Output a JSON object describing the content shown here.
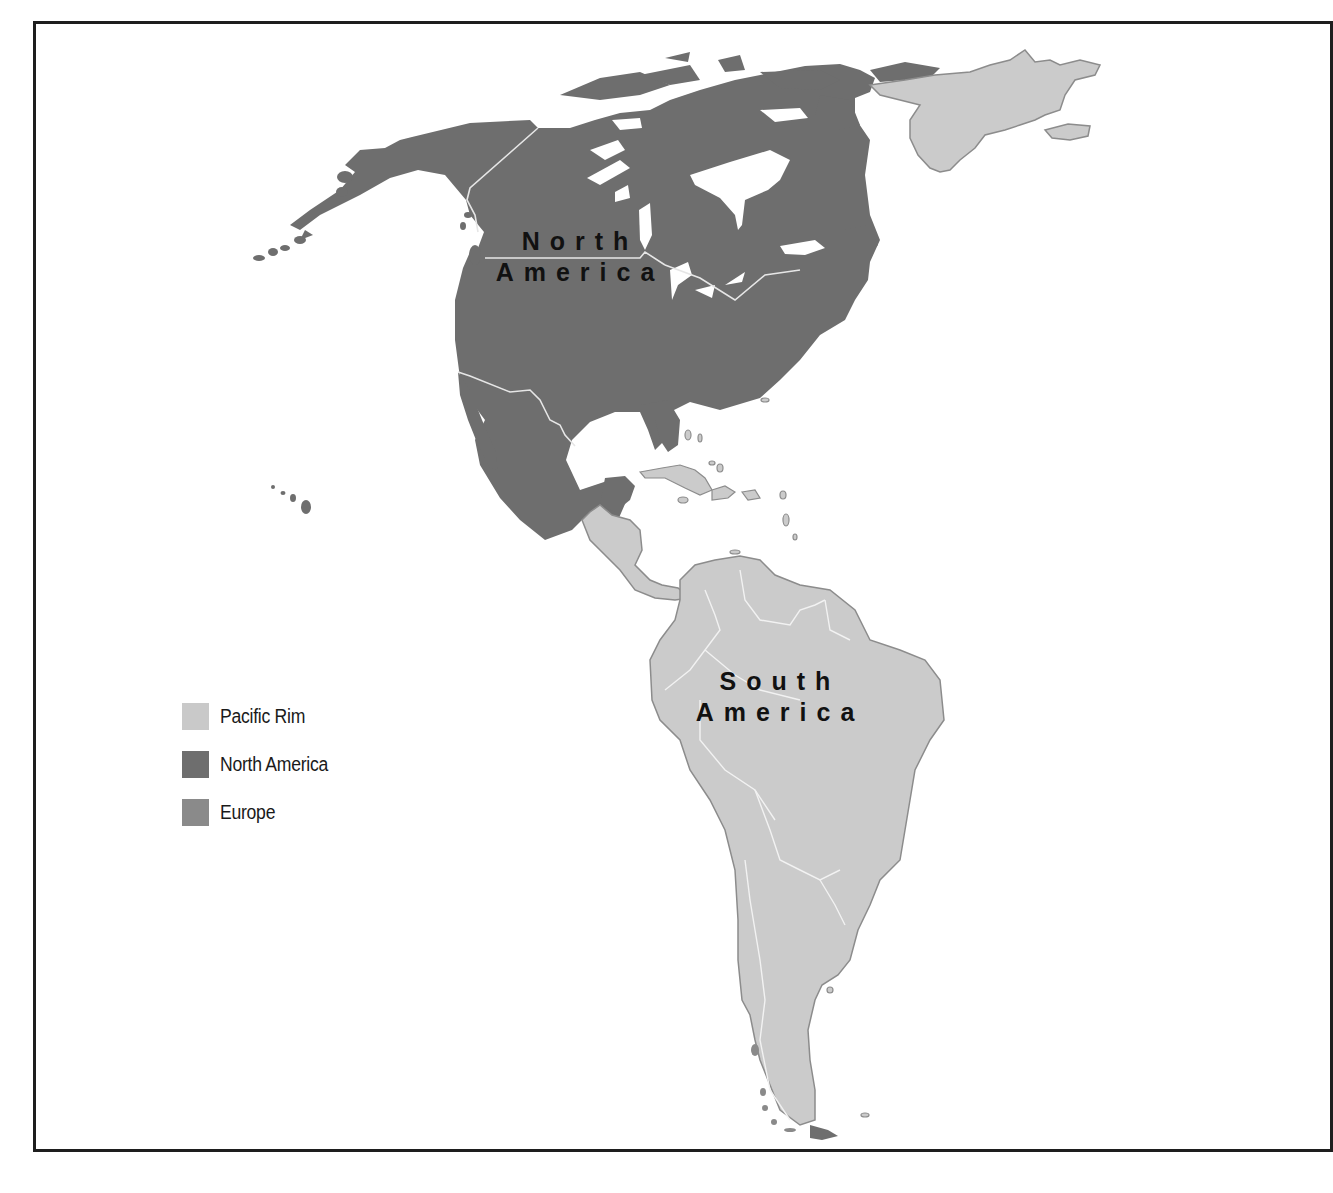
{
  "map": {
    "regions": [
      {
        "id": "north-america",
        "label_line1": "North",
        "label_line2": "America",
        "fill": "#6e6e6e"
      },
      {
        "id": "south-america",
        "label_line1": "South",
        "label_line2": "America",
        "fill": "#cbcbcb"
      },
      {
        "id": "greenland",
        "fill": "#cbcbcb"
      }
    ],
    "colors": {
      "pacific_rim": "#cbcbcb",
      "north_america": "#6e6e6e",
      "europe": "#8a8a8a",
      "outline": "#8c8c8c",
      "border_lines": "#e6e6e6",
      "frame": "#1e1e1e"
    }
  },
  "legend": {
    "items": [
      {
        "label": "Pacific Rim",
        "color": "#c9c9c9"
      },
      {
        "label": "North America",
        "color": "#6e6e6e"
      },
      {
        "label": "Europe",
        "color": "#8a8a8a"
      }
    ]
  }
}
